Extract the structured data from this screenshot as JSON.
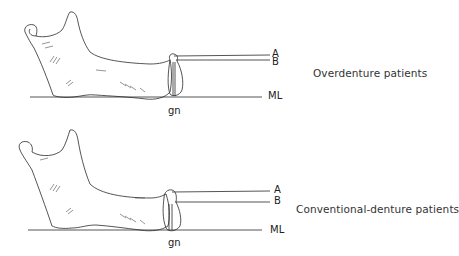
{
  "panels": [
    {
      "caption": "Overdenture patients",
      "labels": {
        "a": "A",
        "b": "B",
        "ml": "ML",
        "gn": "gn"
      }
    },
    {
      "caption": "Conventional-denture patients",
      "labels": {
        "a": "A",
        "b": "B",
        "ml": "ML",
        "gn": "gn"
      }
    }
  ],
  "colors": {
    "line": "#2a2a2a",
    "background": "#ffffff"
  }
}
